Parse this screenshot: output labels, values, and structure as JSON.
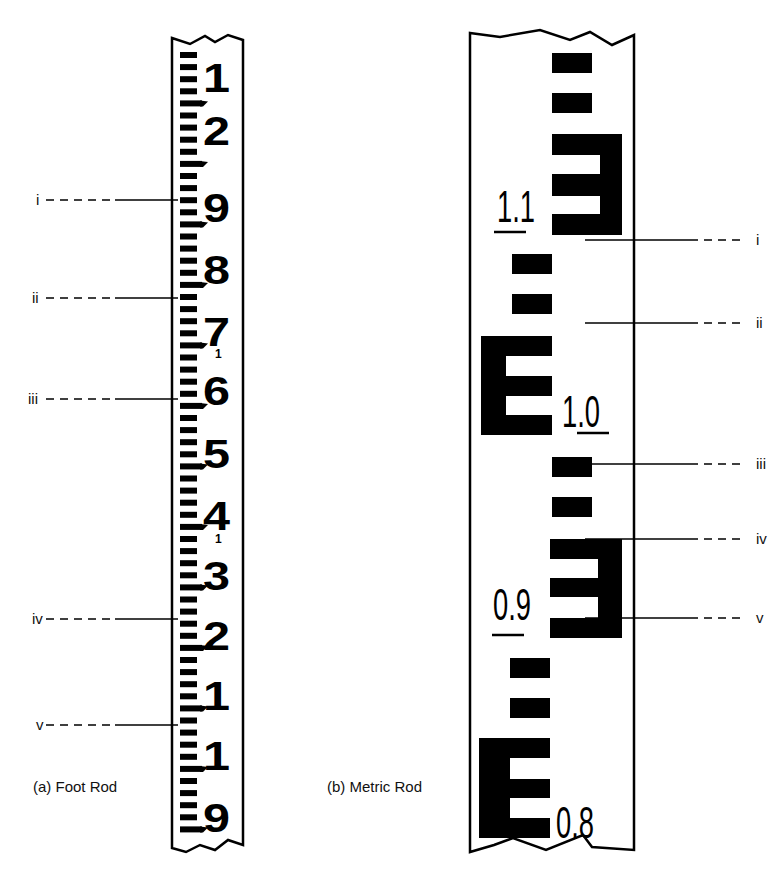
{
  "figure": {
    "colors": {
      "ink": "#000000",
      "paper": "#ffffff"
    },
    "foot_rod": {
      "caption": "(a)  Foot Rod",
      "numbers": [
        {
          "text": "1",
          "y": 92
        },
        {
          "text": "2",
          "y": 145
        },
        {
          "text": "9",
          "y": 222
        },
        {
          "text": "8",
          "y": 284
        },
        {
          "text": "7",
          "y": 346
        },
        {
          "text": "6",
          "y": 405
        },
        {
          "text": "5",
          "y": 468
        },
        {
          "text": "4",
          "y": 530
        },
        {
          "text": "3",
          "y": 590
        },
        {
          "text": "2",
          "y": 650
        },
        {
          "text": "1",
          "y": 710
        },
        {
          "text": "1",
          "y": 770
        },
        {
          "text": "9",
          "y": 832
        }
      ],
      "small_markers": [
        {
          "text": "1",
          "y": 358
        },
        {
          "text": "1",
          "y": 543
        }
      ],
      "leaders": [
        {
          "label": "i",
          "y": 200
        },
        {
          "label": "ii",
          "y": 298
        },
        {
          "label": "iii",
          "y": 399
        },
        {
          "label": "iv",
          "y": 619
        },
        {
          "label": "v",
          "y": 725
        }
      ]
    },
    "metric_rod": {
      "caption": "(b)  Metric Rod",
      "numbers": [
        {
          "text": "1.1",
          "y": 222,
          "x": 497
        },
        {
          "text": "1.0",
          "y": 427,
          "x": 562
        },
        {
          "text": "0.9",
          "y": 620,
          "x": 493
        },
        {
          "text": "0.8",
          "y": 838,
          "x": 556
        }
      ],
      "leaders": [
        {
          "label": "i",
          "y": 240
        },
        {
          "label": "ii",
          "y": 323
        },
        {
          "label": "iii",
          "y": 464
        },
        {
          "label": "iv",
          "y": 539
        },
        {
          "label": "v",
          "y": 618
        }
      ]
    }
  }
}
